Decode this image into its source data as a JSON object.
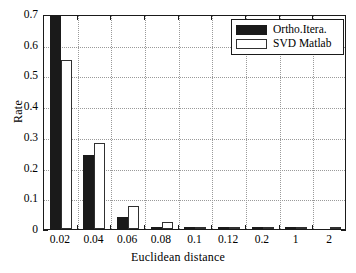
{
  "chart_data": {
    "type": "bar",
    "title": "",
    "xlabel": "Euclidean distance",
    "ylabel": "Rate",
    "categories": [
      "0.02",
      "0.04",
      "0.06",
      "0.08",
      "0.1",
      "0.12",
      "0.2",
      "1",
      "2"
    ],
    "series": [
      {
        "name": "Ortho.Itera.",
        "color": "#1a1a1a",
        "style": "filled",
        "values": [
          0.72,
          0.24,
          0.04,
          0.008,
          0.003,
          0.002,
          0.003,
          0.001,
          0.0
        ]
      },
      {
        "name": "SVD Matlab",
        "color": "#ffffff",
        "style": "outlined",
        "values": [
          0.55,
          0.28,
          0.075,
          0.023,
          0.008,
          0.004,
          0.005,
          0.002,
          0.006
        ]
      }
    ],
    "ylim": [
      0,
      0.7
    ],
    "yticks": [
      "0",
      "0.1",
      "0.2",
      "0.3",
      "0.4",
      "0.5",
      "0.6",
      "0.7"
    ],
    "ytick_values": [
      0,
      0.1,
      0.2,
      0.3,
      0.4,
      0.5,
      0.6,
      0.7
    ],
    "grid": true,
    "grid_style": "dotted",
    "legend_position": "top-right"
  },
  "legend": {
    "entries": [
      {
        "label": "Ortho.Itera."
      },
      {
        "label": "SVD Matlab"
      }
    ]
  },
  "axes": {
    "y_title": "Rate",
    "x_title": "Euclidean distance"
  }
}
